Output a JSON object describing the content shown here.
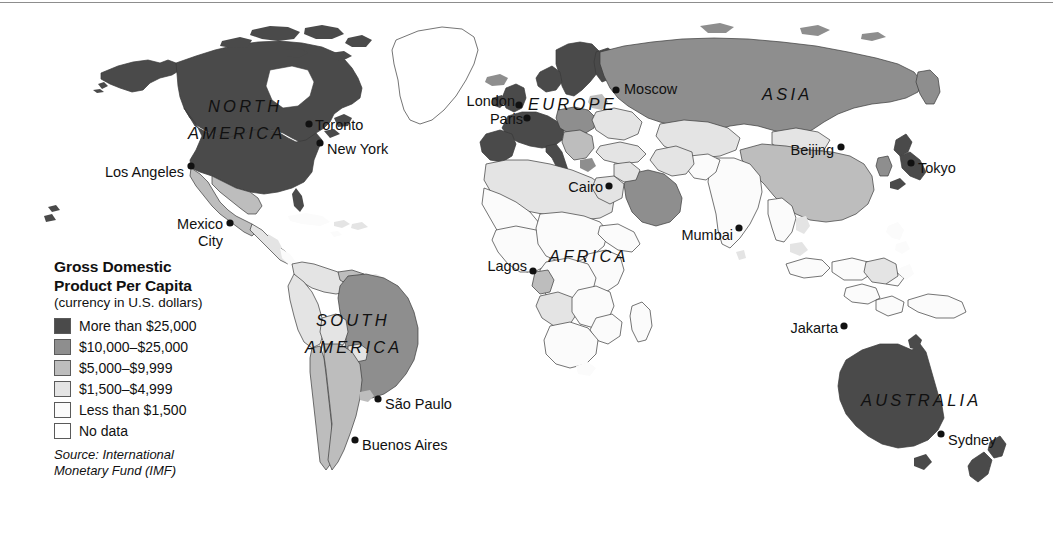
{
  "map": {
    "title": "Gross Domestic Product Per Capita world map",
    "projection": "world"
  },
  "legend": {
    "title_line1": "Gross Domestic",
    "title_line2": "Product Per Capita",
    "subtitle": "(currency in U.S. dollars)",
    "items": [
      {
        "label": "More than $25,000",
        "color": "#4a4a4a"
      },
      {
        "label": "$10,000–$25,000",
        "color": "#8e8e8e"
      },
      {
        "label": "$5,000–$9,999",
        "color": "#bdbdbd"
      },
      {
        "label": "$1,500–$4,999",
        "color": "#e4e4e4"
      },
      {
        "label": "Less than $1,500",
        "color": "#fbfbfb"
      },
      {
        "label": "No data",
        "color": "#ffffff"
      }
    ],
    "source_line1": "Source: International",
    "source_line2": "Monetary Fund (IMF)"
  },
  "continents": [
    {
      "name": "north-america",
      "label": "NORTH",
      "x": 208,
      "y": 112
    },
    {
      "name": "north-america-2",
      "label": "AMERICA",
      "x": 188,
      "y": 139
    },
    {
      "name": "south-america",
      "label": "SOUTH",
      "x": 316,
      "y": 326
    },
    {
      "name": "south-america-2",
      "label": "AMERICA",
      "x": 305,
      "y": 353
    },
    {
      "name": "europe",
      "label": "EUROPE",
      "x": 528,
      "y": 110
    },
    {
      "name": "africa",
      "label": "AFRICA",
      "x": 549,
      "y": 262
    },
    {
      "name": "asia",
      "label": "ASIA",
      "x": 762,
      "y": 100
    },
    {
      "name": "australia",
      "label": "AUSTRALIA",
      "x": 861,
      "y": 406
    }
  ],
  "cities": [
    {
      "name": "los-angeles",
      "label": "Los Angeles",
      "dot_x": 191,
      "dot_y": 166,
      "text_x": 184,
      "text_y": 177,
      "anchor": "end"
    },
    {
      "name": "toronto",
      "label": "Toronto",
      "dot_x": 309,
      "dot_y": 124,
      "text_x": 315,
      "text_y": 130,
      "anchor": "start"
    },
    {
      "name": "new-york",
      "label": "New York",
      "dot_x": 320,
      "dot_y": 143,
      "text_x": 327,
      "text_y": 154,
      "anchor": "start"
    },
    {
      "name": "mexico-city",
      "label": "Mexico",
      "dot_x": 230,
      "dot_y": 223,
      "text_x": 223,
      "text_y": 229,
      "anchor": "end"
    },
    {
      "name": "mexico-city-2",
      "label": "City",
      "dot_x": null,
      "dot_y": null,
      "text_x": 223,
      "text_y": 246,
      "anchor": "end"
    },
    {
      "name": "sao-paulo",
      "label": "São Paulo",
      "dot_x": 378,
      "dot_y": 399,
      "text_x": 385,
      "text_y": 409,
      "anchor": "start"
    },
    {
      "name": "buenos-aires",
      "label": "Buenos Aires",
      "dot_x": 355,
      "dot_y": 440,
      "text_x": 362,
      "text_y": 450,
      "anchor": "start"
    },
    {
      "name": "london",
      "label": "London",
      "dot_x": 519,
      "dot_y": 105,
      "text_x": 515,
      "text_y": 106,
      "anchor": "end"
    },
    {
      "name": "paris",
      "label": "Paris",
      "dot_x": 527,
      "dot_y": 118,
      "text_x": 523,
      "text_y": 124,
      "anchor": "end"
    },
    {
      "name": "moscow",
      "label": "Moscow",
      "dot_x": 616,
      "dot_y": 90,
      "text_x": 624,
      "text_y": 94,
      "anchor": "start"
    },
    {
      "name": "cairo",
      "label": "Cairo",
      "dot_x": 609,
      "dot_y": 186,
      "text_x": 603,
      "text_y": 192,
      "anchor": "end"
    },
    {
      "name": "lagos",
      "label": "Lagos",
      "dot_x": 533,
      "dot_y": 271,
      "text_x": 527,
      "text_y": 271,
      "anchor": "end"
    },
    {
      "name": "beijing",
      "label": "Beijing",
      "dot_x": 841,
      "dot_y": 147,
      "text_x": 834,
      "text_y": 155,
      "anchor": "end"
    },
    {
      "name": "tokyo",
      "label": "Tokyo",
      "dot_x": 911,
      "dot_y": 163,
      "text_x": 918,
      "text_y": 173,
      "anchor": "start"
    },
    {
      "name": "mumbai",
      "label": "Mumbai",
      "dot_x": 739,
      "dot_y": 228,
      "text_x": 733,
      "text_y": 240,
      "anchor": "end"
    },
    {
      "name": "jakarta",
      "label": "Jakarta",
      "dot_x": 844,
      "dot_y": 326,
      "text_x": 838,
      "text_y": 333,
      "anchor": "end"
    },
    {
      "name": "sydney",
      "label": "Sydney",
      "dot_x": 941,
      "dot_y": 434,
      "text_x": 948,
      "text_y": 445,
      "anchor": "start"
    }
  ]
}
